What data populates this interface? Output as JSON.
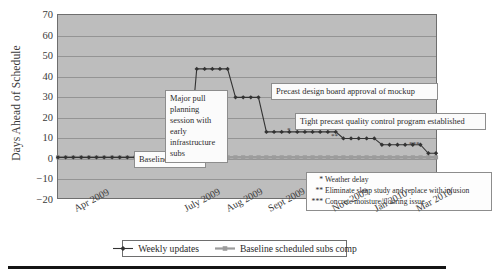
{
  "chart_data": {
    "type": "line",
    "title": "",
    "xlabel": "",
    "ylabel": "Days Ahead of Schedule",
    "ylim": [
      -20,
      70
    ],
    "yticks": [
      70,
      60,
      50,
      40,
      30,
      20,
      10,
      0,
      -10,
      -20
    ],
    "ytick_labels": [
      "70",
      "60",
      "50",
      "40",
      "30",
      "20",
      "10",
      "0",
      "−10",
      "−20"
    ],
    "xtick_labels": [
      "Apr 2009",
      "July 2009",
      "Aug 2009",
      "Sept 2009",
      "Nov 2009",
      "Jan 2010",
      "Mar 2010"
    ],
    "xtick_positions": [
      0.055,
      0.345,
      0.455,
      0.565,
      0.735,
      0.845,
      0.955
    ],
    "grid": true,
    "legend_position": "bottom",
    "series": [
      {
        "name": "Weekly updates",
        "color": "#333333",
        "marker": "diamond",
        "points": [
          {
            "x": 0.0,
            "y": 0
          },
          {
            "x": 0.024,
            "y": 0
          },
          {
            "x": 0.048,
            "y": 0
          },
          {
            "x": 0.073,
            "y": 0
          },
          {
            "x": 0.097,
            "y": 0
          },
          {
            "x": 0.121,
            "y": 0
          },
          {
            "x": 0.145,
            "y": 0
          },
          {
            "x": 0.17,
            "y": 0
          },
          {
            "x": 0.194,
            "y": 0
          },
          {
            "x": 0.218,
            "y": 0
          },
          {
            "x": 0.242,
            "y": 0
          },
          {
            "x": 0.267,
            "y": 0
          },
          {
            "x": 0.291,
            "y": 0
          },
          {
            "x": 0.315,
            "y": 0
          },
          {
            "x": 0.339,
            "y": 0
          },
          {
            "x": 0.364,
            "y": 0
          },
          {
            "x": 0.388,
            "y": 0
          },
          {
            "x": 0.412,
            "y": 0
          },
          {
            "x": 0.436,
            "y": 43.5
          },
          {
            "x": 0.461,
            "y": 43.5
          },
          {
            "x": 0.485,
            "y": 43.5
          },
          {
            "x": 0.509,
            "y": 43.5
          },
          {
            "x": 0.533,
            "y": 43.5
          },
          {
            "x": 0.558,
            "y": 29.5
          },
          {
            "x": 0.582,
            "y": 29.5
          },
          {
            "x": 0.606,
            "y": 29.5
          },
          {
            "x": 0.63,
            "y": 29.5
          },
          {
            "x": 0.655,
            "y": 12.5
          },
          {
            "x": 0.679,
            "y": 12.5
          },
          {
            "x": 0.703,
            "y": 12.5
          },
          {
            "x": 0.727,
            "y": 12.5
          },
          {
            "x": 0.752,
            "y": 12.5
          },
          {
            "x": 0.776,
            "y": 12.5
          },
          {
            "x": 0.8,
            "y": 12.5
          },
          {
            "x": 0.824,
            "y": 12.5
          },
          {
            "x": 0.848,
            "y": 12.5
          },
          {
            "x": 0.873,
            "y": 12.5
          },
          {
            "x": 0.897,
            "y": 9.3
          },
          {
            "x": 0.921,
            "y": 9.3
          },
          {
            "x": 0.945,
            "y": 9.3
          },
          {
            "x": 0.97,
            "y": 9.3
          },
          {
            "x": 0.994,
            "y": 9.3
          },
          {
            "x": 1.018,
            "y": 6.2
          },
          {
            "x": 1.042,
            "y": 6.2
          },
          {
            "x": 1.067,
            "y": 6.2
          },
          {
            "x": 1.091,
            "y": 6.2
          },
          {
            "x": 1.115,
            "y": 6.2
          },
          {
            "x": 1.139,
            "y": 6.2
          },
          {
            "x": 1.164,
            "y": 2.0
          },
          {
            "x": 1.188,
            "y": 2.0
          }
        ]
      },
      {
        "name": "Baseline scheduled subs comp",
        "color": "#9c9c9c",
        "marker": "square",
        "constant_value": 0,
        "x_start": 0.0,
        "x_end": 1.188,
        "n_points": 50
      }
    ]
  },
  "axis": {
    "y_title": "Days Ahead of Schedule"
  },
  "callouts": {
    "baseline": "Baseline schedule",
    "pull_planning": "Major pull planning session with early infrastructure subs",
    "precast_approval": "Precast design board approval of mockup",
    "quality_program": "Tight precast quality control program established"
  },
  "footnotes": [
    {
      "mark": "*",
      "text": "Weather delay"
    },
    {
      "mark": "**",
      "text": "Eliminate sleep study and replace with infusion"
    },
    {
      "mark": "***",
      "text": "Concrete moisture/flooring issue"
    }
  ],
  "inline_marks": [
    {
      "mark": "*",
      "left": 286,
      "top": 126
    },
    {
      "mark": "**",
      "left": 330,
      "top": 132
    },
    {
      "mark": "***",
      "left": 408,
      "top": 140
    }
  ],
  "legend": {
    "entries": [
      {
        "label": "Weekly updates",
        "color": "#333333",
        "marker": "diamond"
      },
      {
        "label": "Baseline scheduled subs comp",
        "color": "#9c9c9c",
        "marker": "square"
      }
    ]
  },
  "colors": {
    "plot_background": "#bdbdbd",
    "gridline": "#949494",
    "frame": "#6e6e6e",
    "series_primary": "#333333",
    "series_baseline": "#9c9c9c",
    "rule": "#141414"
  }
}
